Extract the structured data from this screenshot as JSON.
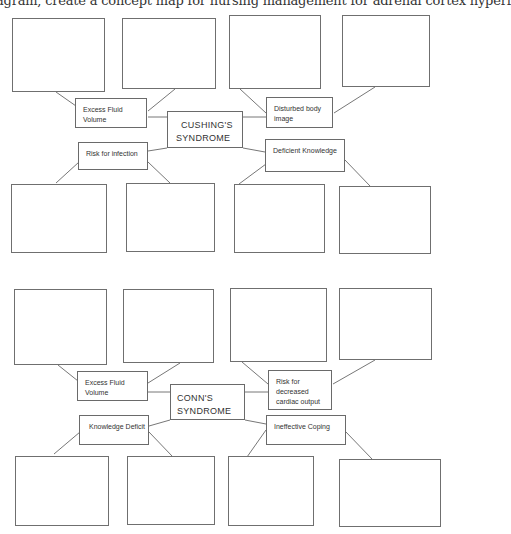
{
  "header": {
    "text": "iagram, create a concept map for nursing management for adrenal cortex hyperf"
  },
  "diagrams": [
    {
      "id": "cushings",
      "top": 0,
      "center": {
        "label_line1": "CUSHING'S",
        "label_line2": "SYNDROME",
        "x": 167,
        "y": 111,
        "w": 76,
        "h": 37
      },
      "nodes": [
        {
          "label": "Excess Fluid Volume",
          "x": 75,
          "y": 98,
          "w": 72,
          "h": 30
        },
        {
          "label": "Disturbed body image",
          "x": 266,
          "y": 97,
          "w": 67,
          "h": 31
        },
        {
          "label": "Risk for infection",
          "x": 78,
          "y": 142,
          "w": 70,
          "h": 28
        },
        {
          "label": "Deficient Knowledge",
          "x": 265,
          "y": 139,
          "w": 80,
          "h": 33
        }
      ],
      "blanks": [
        {
          "x": 12,
          "y": 18,
          "w": 93,
          "h": 74
        },
        {
          "x": 122,
          "y": 18,
          "w": 94,
          "h": 71
        },
        {
          "x": 229,
          "y": 15,
          "w": 92,
          "h": 74
        },
        {
          "x": 342,
          "y": 15,
          "w": 88,
          "h": 72
        },
        {
          "x": 11,
          "y": 184,
          "w": 96,
          "h": 69
        },
        {
          "x": 126,
          "y": 183,
          "w": 89,
          "h": 69
        },
        {
          "x": 234,
          "y": 184,
          "w": 91,
          "h": 69
        },
        {
          "x": 339,
          "y": 186,
          "w": 92,
          "h": 68
        }
      ],
      "links": [
        [
          56,
          92,
          76,
          106
        ],
        [
          175,
          89,
          148,
          111
        ],
        [
          240,
          89,
          266,
          113
        ],
        [
          375,
          87,
          334,
          113
        ],
        [
          148,
          117,
          167,
          117
        ],
        [
          243,
          117,
          266,
          117
        ],
        [
          148,
          151,
          167,
          148
        ],
        [
          243,
          148,
          265,
          152
        ],
        [
          56,
          183,
          79,
          162
        ],
        [
          170,
          183,
          148,
          162
        ],
        [
          239,
          184,
          266,
          164
        ],
        [
          370,
          186,
          345,
          160
        ]
      ]
    },
    {
      "id": "conns",
      "top": 0,
      "center": {
        "label_line1": "CONN'S",
        "label_line2": "SYNDROME",
        "x": 170,
        "y": 384,
        "w": 75,
        "h": 36
      },
      "nodes": [
        {
          "label": "Excess Fluid Volume",
          "x": 77,
          "y": 371,
          "w": 71,
          "h": 30
        },
        {
          "label": "Risk for decreased cardiac output",
          "x": 268,
          "y": 370,
          "w": 64,
          "h": 40
        },
        {
          "label": "Knowledge Deficit",
          "x": 79,
          "y": 415,
          "w": 70,
          "h": 30
        },
        {
          "label": "Ineffective Coping",
          "x": 266,
          "y": 415,
          "w": 80,
          "h": 30
        }
      ],
      "blanks": [
        {
          "x": 14,
          "y": 289,
          "w": 93,
          "h": 76
        },
        {
          "x": 123,
          "y": 289,
          "w": 91,
          "h": 74
        },
        {
          "x": 230,
          "y": 288,
          "w": 97,
          "h": 74
        },
        {
          "x": 339,
          "y": 288,
          "w": 93,
          "h": 72
        },
        {
          "x": 15,
          "y": 456,
          "w": 94,
          "h": 70
        },
        {
          "x": 127,
          "y": 456,
          "w": 88,
          "h": 69
        },
        {
          "x": 228,
          "y": 456,
          "w": 86,
          "h": 70
        },
        {
          "x": 339,
          "y": 459,
          "w": 102,
          "h": 68
        }
      ],
      "links": [
        [
          58,
          365,
          78,
          381
        ],
        [
          180,
          363,
          148,
          383
        ],
        [
          242,
          362,
          268,
          384
        ],
        [
          375,
          360,
          333,
          384
        ],
        [
          148,
          392,
          170,
          392
        ],
        [
          245,
          392,
          268,
          392
        ],
        [
          149,
          426,
          170,
          420
        ],
        [
          245,
          420,
          266,
          424
        ],
        [
          54,
          454,
          80,
          432
        ],
        [
          172,
          456,
          149,
          432
        ],
        [
          247,
          457,
          266,
          430
        ],
        [
          372,
          459,
          346,
          432
        ]
      ]
    }
  ]
}
